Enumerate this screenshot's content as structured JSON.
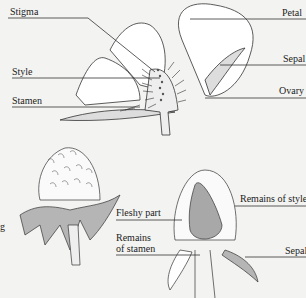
{
  "diagram": {
    "labels": {
      "stigma": "Stigma",
      "style": "Style",
      "stamen": "Stamen",
      "petal": "Petal",
      "sepal_top": "Sepal",
      "ovary": "Ovary",
      "fleshy_part": "Fleshy part",
      "remains_of_stamen_1": "Remains",
      "remains_of_stamen_2": "of stamen",
      "remains_of_style": "Remains of style",
      "sepal_bottom": "Sepal",
      "partial_left": "g"
    },
    "colors": {
      "background": "#f3f3f1",
      "line": "#333333",
      "sepal_fill": "#b5b5b5",
      "fleshy_fill": "#a8a8a8",
      "petal_fill": "#ffffff"
    }
  }
}
